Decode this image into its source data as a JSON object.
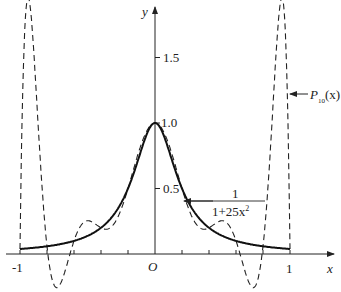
{
  "chart_data": {
    "type": "line",
    "title": "",
    "xlabel": "x",
    "ylabel": "y",
    "origin_label": "O",
    "xlim": [
      -1,
      1
    ],
    "ylim": [
      -0.3,
      1.9
    ],
    "x_ticks": [
      -1,
      -0.8,
      -0.6,
      -0.4,
      -0.2,
      0,
      0.2,
      0.4,
      0.6,
      0.8,
      1
    ],
    "x_tick_labels": {
      "-1": "-1",
      "1": "1"
    },
    "y_tick_labels": [
      "0.5",
      "1.0",
      "1.5"
    ],
    "y_ticks": [
      0.5,
      1.0,
      1.5
    ],
    "grid": false,
    "series": [
      {
        "name": "1/(1+25x^2)",
        "style": "solid",
        "function": "runge",
        "x": [
          -1,
          -0.8,
          -0.6,
          -0.4,
          -0.2,
          0,
          0.2,
          0.4,
          0.6,
          0.8,
          1
        ],
        "values": [
          0.038,
          0.059,
          0.1,
          0.2,
          0.5,
          1.0,
          0.5,
          0.2,
          0.1,
          0.059,
          0.038
        ]
      },
      {
        "name": "P10(x)",
        "style": "dashed",
        "function": "lagrange_interpolant_degree_10",
        "x": [
          -1,
          -0.95,
          -0.8,
          -0.7,
          -0.6,
          -0.5,
          -0.4,
          -0.3,
          -0.2,
          0,
          0.2,
          0.3,
          0.4,
          0.5,
          0.6,
          0.7,
          0.8,
          0.95,
          1
        ],
        "values": [
          0.038,
          1.92,
          0.059,
          -0.23,
          0.1,
          0.25,
          0.2,
          0.24,
          0.5,
          1.0,
          0.5,
          0.24,
          0.2,
          0.25,
          0.1,
          -0.23,
          0.059,
          1.92,
          0.038
        ]
      }
    ],
    "annotations": [
      {
        "text_numerator": "1",
        "text_denominator": "1+25x",
        "exponent": "2",
        "points_to": [
          0.2,
          0.5
        ]
      },
      {
        "text": "P",
        "subscript": "10",
        "suffix": "(x)",
        "points_to": [
          0.95,
          1.0
        ]
      }
    ]
  }
}
